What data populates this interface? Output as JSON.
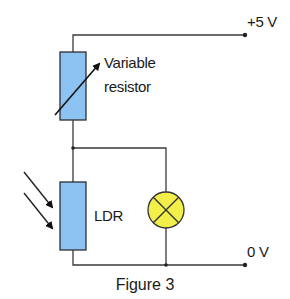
{
  "figure": {
    "top_partial_text": "",
    "caption": "Figure 3",
    "colors": {
      "resistor_fill": "#8cc3f2",
      "lamp_fill": "#f2ef4a",
      "wire": "#3a3a3a",
      "text": "#1a1a1a"
    },
    "terminals": {
      "positive": "+5 V",
      "ground": "0 V"
    },
    "components": {
      "variable_resistor": {
        "label_line1": "Variable",
        "label_line2": "resistor"
      },
      "ldr": {
        "label": "LDR",
        "incident_light_arrows": 2
      },
      "lamp": {
        "symbol": "lamp"
      }
    }
  }
}
